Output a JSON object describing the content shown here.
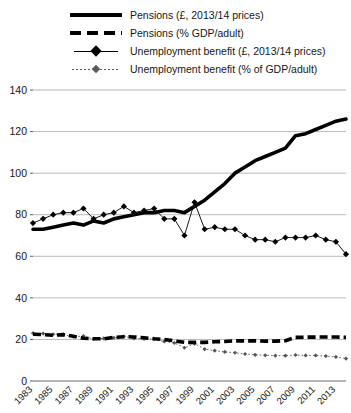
{
  "chart_data": {
    "type": "line",
    "title": "",
    "subtitle": "",
    "xlabel": "",
    "ylabel": "",
    "grid": true,
    "legend_position": "top",
    "ylim": [
      0,
      140
    ],
    "ytick_labels": [
      "0",
      "20",
      "40",
      "60",
      "80",
      "100",
      "120",
      "140"
    ],
    "ytick_values": [
      0,
      20,
      40,
      60,
      80,
      100,
      120,
      140
    ],
    "xtick_labels": [
      "1983",
      "1985",
      "1987",
      "1989",
      "1991",
      "1993",
      "1995",
      "1997",
      "1999",
      "2001",
      "2003",
      "2005",
      "2007",
      "2009",
      "2011",
      "2013"
    ],
    "x": [
      1983,
      1984,
      1985,
      1986,
      1987,
      1988,
      1989,
      1990,
      1991,
      1992,
      1993,
      1994,
      1995,
      1996,
      1997,
      1998,
      1999,
      2000,
      2001,
      2002,
      2003,
      2004,
      2005,
      2006,
      2007,
      2008,
      2009,
      2010,
      2011,
      2012,
      2013,
      2014
    ],
    "series": [
      {
        "name": "Pensions (£, 2013/14 prices)",
        "style": "solid-thick",
        "values": [
          73,
          73,
          74,
          75,
          76,
          75,
          77,
          76,
          78,
          79,
          80,
          81,
          81,
          82,
          82,
          81,
          84,
          87,
          91,
          95,
          100,
          103,
          106,
          108,
          110,
          112,
          118,
          119,
          121,
          123,
          125,
          126
        ]
      },
      {
        "name": "Unemployment benefit (£, 2013/14 prices)",
        "style": "thin-diamond",
        "values": [
          76,
          78,
          80,
          81,
          81,
          83,
          78,
          80,
          81,
          84,
          81,
          82,
          83,
          78,
          78,
          70,
          86,
          73,
          74,
          73,
          73,
          70,
          68,
          68,
          67,
          69,
          69,
          69,
          70,
          68,
          67,
          61
        ]
      },
      {
        "name": "Pensions (% GDP/adult)",
        "style": "dashed-thick",
        "values": [
          22.5,
          22.3,
          22.0,
          22.3,
          21.5,
          20.6,
          20.3,
          20.3,
          21.0,
          21.3,
          21.2,
          20.8,
          20.3,
          20.0,
          19.3,
          18.6,
          18.6,
          18.6,
          18.9,
          19.0,
          19.3,
          19.3,
          19.3,
          19.2,
          19.2,
          19.4,
          21.0,
          21.1,
          21.1,
          21.2,
          21.2,
          21.0
        ]
      },
      {
        "name": "Unemployment benefit (% of GDP/adult)",
        "style": "dotted-diamond",
        "values": [
          23.0,
          22.8,
          22.5,
          22.3,
          21.3,
          21.6,
          20.2,
          20.5,
          20.8,
          21.4,
          20.5,
          20.3,
          20.2,
          19.0,
          18.3,
          16.0,
          18.0,
          15.3,
          14.6,
          14.0,
          13.6,
          13.0,
          12.6,
          12.4,
          12.2,
          12.2,
          12.5,
          12.3,
          12.3,
          12.0,
          11.6,
          10.8
        ]
      }
    ]
  },
  "legend": {
    "items": [
      {
        "label": "Pensions (£, 2013/14 prices)",
        "style": "solid-thick"
      },
      {
        "label": "Pensions (% GDP/adult)",
        "style": "dashed-thick"
      },
      {
        "label": "Unemployment benefit (£, 2013/14 prices)",
        "style": "thin-diamond"
      },
      {
        "label": "Unemployment benefit (% of GDP/adult)",
        "style": "dotted-diamond"
      }
    ]
  },
  "colors": {
    "line": "#000000",
    "dotted": "#555555",
    "grid": "#9a9a9a",
    "axis": "#6b6b6b",
    "text": "#161616",
    "background": "#ffffff"
  }
}
